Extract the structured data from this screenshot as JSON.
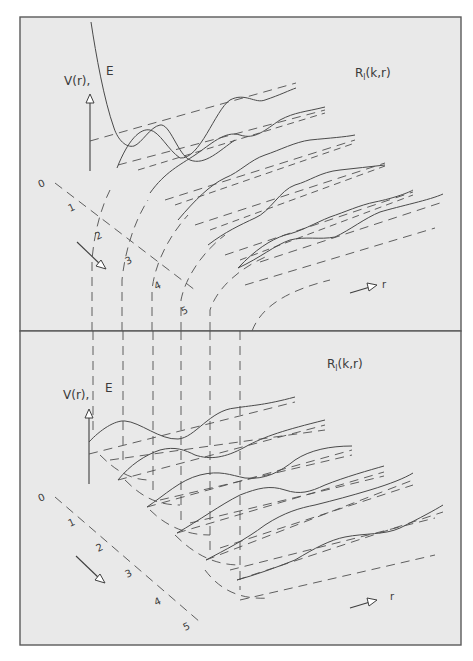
{
  "figure": {
    "panels": [
      {
        "id": "top",
        "title": "R",
        "title_sub": "l",
        "title_args": "(k,r)",
        "axis_label": "V(r),",
        "energy_label": "E",
        "r_label": "r",
        "l_ticks": [
          "0",
          "1",
          "2",
          "3",
          "4",
          "5"
        ]
      },
      {
        "id": "bottom",
        "title": "R",
        "title_sub": "l",
        "title_args": "(k,r)",
        "axis_label": "V(r),",
        "energy_label": "E",
        "r_label": "r",
        "l_ticks": [
          "0",
          "1",
          "2",
          "3",
          "4",
          "5"
        ]
      }
    ],
    "colors": {
      "background": "#e9e9e9",
      "line": "#4a4a4a",
      "frame": "#5a5a5a"
    }
  }
}
